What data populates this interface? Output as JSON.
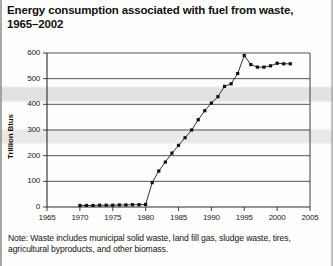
{
  "title": "Energy consumption associated with fuel from waste, 1965–2002",
  "note": "Note: Waste includes municipal solid waste, land fill gas, sludge waste, tires, agricultural byproducts, and other biomass.",
  "chart_data": {
    "type": "line",
    "title": "Energy consumption associated with fuel from waste, 1965–2002",
    "xlabel": "",
    "ylabel": "Trillion Btus",
    "xlim": [
      1965,
      2005
    ],
    "ylim": [
      0,
      600
    ],
    "xticks": [
      1965,
      1970,
      1975,
      1980,
      1985,
      1990,
      1995,
      2000,
      2005
    ],
    "yticks": [
      0,
      100,
      200,
      300,
      400,
      500,
      600
    ],
    "grid": "horizontal",
    "legend": "none",
    "marker": "filled-square",
    "x": [
      1970,
      1971,
      1972,
      1973,
      1974,
      1975,
      1976,
      1977,
      1978,
      1979,
      1980,
      1981,
      1982,
      1983,
      1984,
      1985,
      1986,
      1987,
      1988,
      1989,
      1990,
      1991,
      1992,
      1993,
      1994,
      1995,
      1996,
      1997,
      1998,
      1999,
      2000,
      2001,
      2002
    ],
    "values": [
      6,
      6,
      6,
      7,
      7,
      7,
      8,
      8,
      9,
      9,
      10,
      95,
      140,
      175,
      210,
      240,
      270,
      300,
      340,
      375,
      405,
      430,
      470,
      480,
      520,
      590,
      555,
      545,
      545,
      550,
      560,
      558,
      558
    ],
    "annotations": []
  },
  "yticks_labels": [
    "600",
    "500",
    "400",
    "300",
    "200",
    "100",
    "0"
  ],
  "xticks_labels": [
    "1965",
    "1970",
    "1975",
    "1980",
    "1985",
    "1990",
    "1995",
    "2000",
    "2005"
  ]
}
